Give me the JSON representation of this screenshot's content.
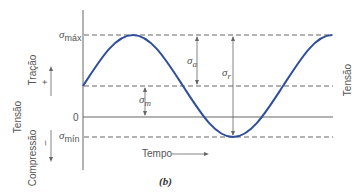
{
  "figure": {
    "caption": "(b)",
    "y_axis_label_left": "Tensão",
    "y_axis_label_right": "Tensão",
    "tension_label": "Tração",
    "tension_sign": "+",
    "compression_label": "Compressão",
    "compression_sign": "–",
    "zero_label": "0",
    "x_axis_label": "Tempo",
    "levels": {
      "max": {
        "symbol": "σ",
        "subscript": "máx"
      },
      "min": {
        "symbol": "σ",
        "subscript": "mín"
      }
    },
    "annotations": {
      "amplitude": {
        "symbol": "σ",
        "subscript": "a"
      },
      "range": {
        "symbol": "σ",
        "subscript": "r"
      },
      "mean": {
        "symbol": "σ",
        "subscript": "m"
      }
    },
    "colors": {
      "curve": "#2f4f9a",
      "lines": "#555555"
    }
  }
}
